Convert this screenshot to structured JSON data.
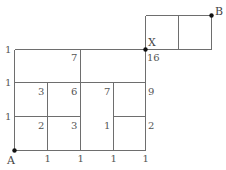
{
  "diagram": {
    "points": {
      "A": {
        "label": "A"
      },
      "B": {
        "label": "B"
      },
      "X": {
        "label": "X"
      }
    },
    "left_edge_counts": [
      "1",
      "1",
      "1"
    ],
    "bottom_edge_counts": [
      "1",
      "1",
      "1",
      "1"
    ],
    "row1": {
      "c1": "7",
      "x_value": "16"
    },
    "row2": [
      "3",
      "6",
      "7",
      "9"
    ],
    "row3": [
      "2",
      "3",
      "1",
      "2"
    ],
    "colors": {
      "line": "#6e6e6e",
      "text": "#555555",
      "point": "#111111"
    }
  }
}
